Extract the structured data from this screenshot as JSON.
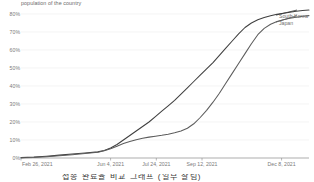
{
  "caption": {
    "top_text": "population of the country"
  },
  "legend": {
    "position": "right",
    "entries": [
      {
        "label": "South Korea",
        "color": "#3f3f3f"
      },
      {
        "label": "Japan",
        "color": "#5c5c5c"
      }
    ]
  },
  "axes": {
    "y_ticks": [
      "80%",
      "70%",
      "60%",
      "50%",
      "40%",
      "30%",
      "20%",
      "10%",
      "0%"
    ],
    "x_ticks": [
      "Feb 26, 2021",
      "Jun 4, 2021",
      "Jul 24, 2021",
      "Sep 12, 2021",
      "Dec 8, 2021"
    ]
  },
  "footer": {
    "cut_text": "접종 완료율 비교 그래프 (일부 잘림)"
  },
  "chart_data": {
    "type": "line",
    "title": "",
    "subtitle": "population of the country",
    "xlabel": "",
    "ylabel": "",
    "ylim": [
      0,
      85
    ],
    "ytick_values": [
      0,
      10,
      20,
      30,
      40,
      50,
      60,
      70,
      80
    ],
    "ytick_labels": [
      "0%",
      "10%",
      "20%",
      "30%",
      "40%",
      "50%",
      "60%",
      "70%",
      "80%"
    ],
    "grid": true,
    "legend_position": "right",
    "x_tick_labels": [
      "Feb 26, 2021",
      "Jun 4, 2021",
      "Jul 24, 2021",
      "Sep 12, 2021",
      "Dec 8, 2021"
    ],
    "x_tick_positions": [
      0,
      98,
      148,
      198,
      285
    ],
    "x_range_days": [
      0,
      315
    ],
    "series": [
      {
        "name": "South Korea",
        "color": "#3f3f3f",
        "x": [
          0,
          14,
          28,
          42,
          56,
          70,
          84,
          91,
          98,
          105,
          112,
          119,
          126,
          133,
          140,
          147,
          154,
          161,
          168,
          175,
          182,
          189,
          196,
          203,
          210,
          217,
          224,
          231,
          238,
          245,
          252,
          259,
          266,
          273,
          280,
          287,
          294,
          301,
          308,
          315
        ],
        "values": [
          0.2,
          0.5,
          1.0,
          1.6,
          2.2,
          2.8,
          3.4,
          4.2,
          5.6,
          7.5,
          10.0,
          12.5,
          15.0,
          17.5,
          20.0,
          23.0,
          26.0,
          29.0,
          32.0,
          35.5,
          39.0,
          42.5,
          46.0,
          49.5,
          53.0,
          57.0,
          61.0,
          65.0,
          69.0,
          72.5,
          75.0,
          76.8,
          78.0,
          79.0,
          79.8,
          80.4,
          81.0,
          81.5,
          81.9,
          82.2
        ]
      },
      {
        "name": "Japan",
        "color": "#5c5c5c",
        "x": [
          0,
          14,
          28,
          42,
          56,
          70,
          84,
          91,
          98,
          105,
          112,
          119,
          126,
          133,
          140,
          147,
          154,
          161,
          168,
          175,
          182,
          189,
          196,
          203,
          210,
          217,
          224,
          231,
          238,
          245,
          252,
          259,
          266,
          273,
          280,
          287,
          294,
          301,
          308,
          315
        ],
        "values": [
          0.1,
          0.3,
          0.7,
          1.2,
          1.8,
          2.5,
          3.2,
          4.0,
          5.2,
          6.5,
          8.0,
          9.2,
          10.2,
          11.0,
          11.6,
          12.1,
          12.6,
          13.2,
          14.0,
          15.0,
          16.5,
          19.0,
          22.5,
          26.5,
          31.0,
          36.0,
          41.5,
          47.0,
          52.5,
          58.0,
          63.5,
          68.5,
          72.0,
          74.3,
          75.8,
          76.8,
          77.6,
          78.2,
          78.7,
          79.1
        ]
      }
    ],
    "annotations": [
      {
        "text": "South Korea",
        "at_x": 315,
        "at_y": 82.2
      },
      {
        "text": "Japan",
        "at_x": 315,
        "at_y": 79.1
      }
    ]
  }
}
